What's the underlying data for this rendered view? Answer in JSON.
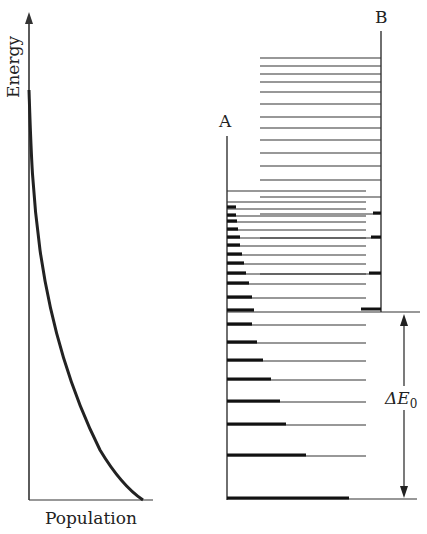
{
  "left_plot": {
    "y_label": "Energy",
    "x_label": "Population",
    "curve": "exponential decay of population with energy (Boltzmann distribution)"
  },
  "right_diagram": {
    "label_a": "A",
    "label_b": "B",
    "gap_label": "ΔE",
    "gap_subscript": "0",
    "a_levels_y": [
      191,
      202,
      209,
      216,
      222,
      230,
      238,
      246,
      255,
      264,
      274,
      284,
      298,
      311,
      325,
      343,
      361,
      380,
      402,
      425,
      456,
      499
    ],
    "a_level_bar_end_x": [
      227,
      227,
      236,
      235,
      237,
      238,
      240,
      240,
      242,
      244,
      246,
      249,
      252,
      254,
      252,
      257,
      263,
      271,
      280,
      286,
      306,
      349
    ],
    "b_levels_y": [
      58,
      66,
      74,
      82,
      92,
      104,
      117,
      128,
      140,
      153,
      166,
      180,
      197,
      214,
      238,
      274,
      310
    ]
  }
}
